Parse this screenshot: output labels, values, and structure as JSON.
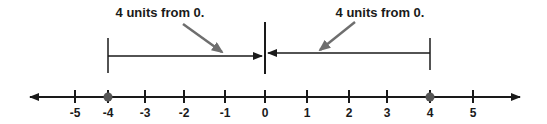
{
  "diagram": {
    "type": "number-line-absolute-value",
    "annotations": [
      {
        "text": "4 units from 0.",
        "x": 160,
        "y": 17
      },
      {
        "text": "4 units from 0.",
        "x": 380,
        "y": 17
      }
    ],
    "ticks": [
      {
        "label": "-5",
        "x": 75
      },
      {
        "label": "-4",
        "x": 108
      },
      {
        "label": "-3",
        "x": 145
      },
      {
        "label": "-2",
        "x": 184
      },
      {
        "label": "-1",
        "x": 225
      },
      {
        "label": "0",
        "x": 265
      },
      {
        "label": "1",
        "x": 307
      },
      {
        "label": "2",
        "x": 349
      },
      {
        "label": "3",
        "x": 387
      },
      {
        "label": "4",
        "x": 430
      },
      {
        "label": "5",
        "x": 473
      }
    ],
    "points": [
      {
        "value": -4,
        "x": 108
      },
      {
        "value": 4,
        "x": 430
      }
    ],
    "colors": {
      "line": "#1a1a1a",
      "pointer": "#6e6e6e",
      "point": "#555555"
    }
  }
}
